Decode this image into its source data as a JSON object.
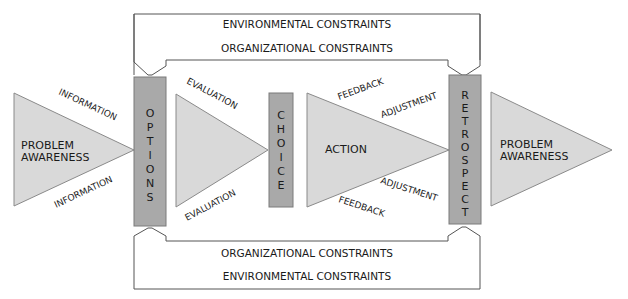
{
  "diagram": {
    "top_partial_text": "",
    "constraints": {
      "top_outer": "ENVIRONMENTAL CONSTRAINTS",
      "top_inner": "ORGANIZATIONAL CONSTRAINTS",
      "bottom_inner": "ORGANIZATIONAL CONSTRAINTS",
      "bottom_outer": "ENVIRONMENTAL CONSTRAINTS"
    },
    "triangles": {
      "problem_left": [
        "PROBLEM",
        "AWARENESS"
      ],
      "evaluation": "",
      "action": "ACTION",
      "problem_right": [
        "PROBLEM",
        "AWARENESS"
      ]
    },
    "bars": {
      "options": [
        "O",
        "P",
        "T",
        "I",
        "O",
        "N",
        "S"
      ],
      "choice": [
        "C",
        "H",
        "O",
        "I",
        "C",
        "E"
      ],
      "retrospect": [
        "R",
        "E",
        "T",
        "R",
        "O",
        "S",
        "P",
        "E",
        "C",
        "T"
      ]
    },
    "flow_labels": {
      "information_top": "INFORMATION",
      "information_bottom": "INFORMATION",
      "evaluation_top": "EVALUATION",
      "evaluation_bottom": "EVALUATION",
      "feedback_top": "FEEDBACK",
      "adjustment_top": "ADJUSTMENT",
      "adjustment_bottom": "ADJUSTMENT",
      "feedback_bottom": "FEEDBACK"
    },
    "colors": {
      "triangle_fill": "#d9d9d9",
      "triangle_stroke": "#8a8a8a",
      "bar_fill": "#a9a9a9",
      "bar_stroke": "#7a7a7a",
      "frame_stroke": "#555555",
      "text": "#1a1a1a"
    }
  }
}
